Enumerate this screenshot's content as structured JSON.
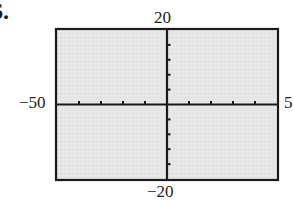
{
  "problem": {
    "number": "6."
  },
  "chart_data": {
    "type": "line",
    "title": "",
    "xlabel": "",
    "ylabel": "",
    "xlim": [
      -50,
      50
    ],
    "ylim": [
      -20,
      20
    ],
    "xscale": 10,
    "yscale": 4,
    "x_ticks": [
      -40,
      -30,
      -20,
      -10,
      10,
      20,
      30,
      40
    ],
    "y_ticks": [
      -16,
      -12,
      -8,
      -4,
      4,
      8,
      12,
      16
    ],
    "tick_labels": {
      "xmin": "−50",
      "xmax": "50",
      "ymax": "20",
      "ymin": "−20"
    },
    "series": [],
    "grid": false,
    "legend": null,
    "background_color": "#e6e6e6",
    "frame_color": "#1a1a1a"
  }
}
